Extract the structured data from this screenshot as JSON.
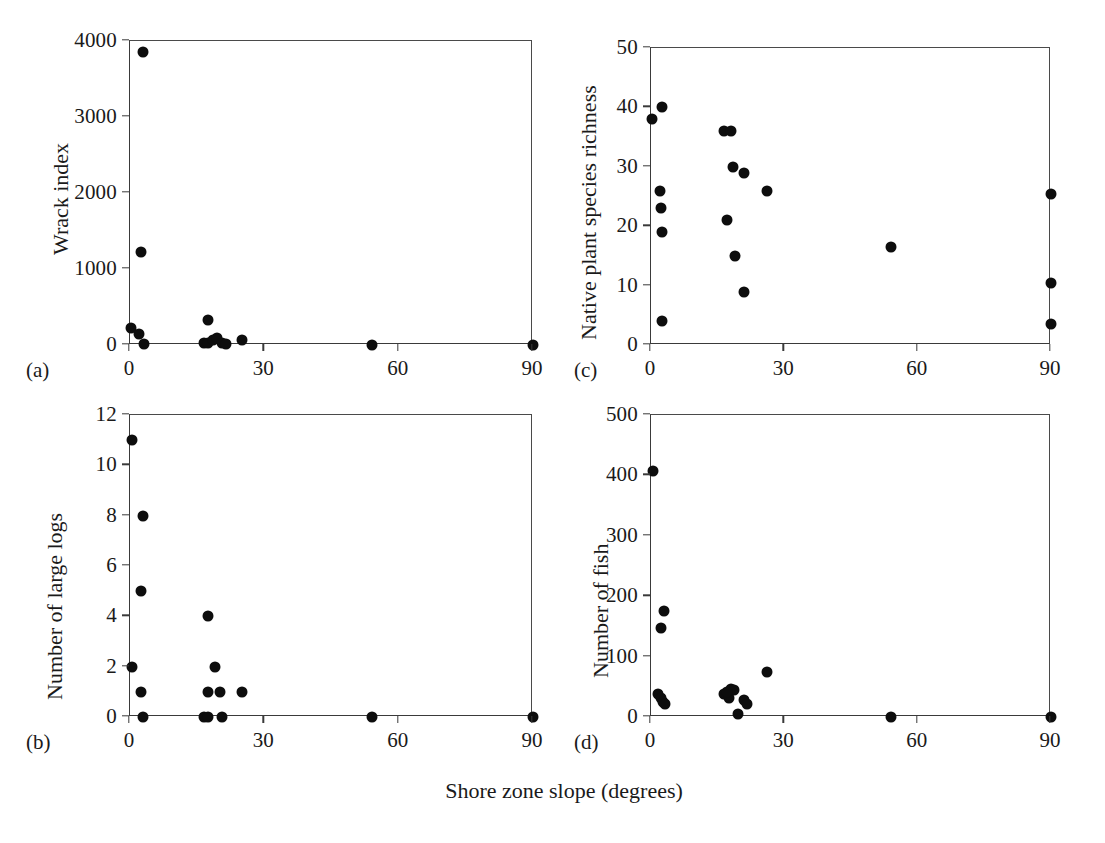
{
  "figure": {
    "shared_xaxis_title": "Shore zone slope (degrees)"
  },
  "panels": [
    {
      "letter": "(a)",
      "ylabel": "Wrack index",
      "xticks": [
        "0",
        "30",
        "60",
        "90"
      ],
      "yticks": [
        "0",
        "1000",
        "2000",
        "3000",
        "4000"
      ]
    },
    {
      "letter": "(b)",
      "ylabel": "Number of large logs",
      "xticks": [
        "0",
        "30",
        "60",
        "90"
      ],
      "yticks": [
        "0",
        "2",
        "4",
        "6",
        "8",
        "10",
        "12"
      ]
    },
    {
      "letter": "(c)",
      "ylabel": "Native plant species richness",
      "xticks": [
        "0",
        "30",
        "60",
        "90"
      ],
      "yticks": [
        "0",
        "10",
        "20",
        "30",
        "40",
        "50"
      ]
    },
    {
      "letter": "(d)",
      "ylabel": "Number of fish",
      "xticks": [
        "0",
        "30",
        "60",
        "90"
      ],
      "yticks": [
        "0",
        "100",
        "200",
        "300",
        "400",
        "500"
      ]
    }
  ],
  "chart_data": [
    {
      "type": "scatter",
      "panel": "a",
      "title": "",
      "xlabel": "Shore zone slope (degrees)",
      "ylabel": "Wrack index",
      "xlim": [
        0,
        90
      ],
      "ylim": [
        0,
        4000
      ],
      "xticks": [
        0,
        30,
        60,
        90
      ],
      "yticks": [
        0,
        1000,
        2000,
        3000,
        4000
      ],
      "grid": false,
      "legend": "none",
      "marker": "filled-circle",
      "marker_color": "#0d0d0d",
      "points": [
        {
          "x": 3.0,
          "y": 3850
        },
        {
          "x": 2.5,
          "y": 1220
        },
        {
          "x": 0.3,
          "y": 230
        },
        {
          "x": 2.0,
          "y": 140
        },
        {
          "x": 3.2,
          "y": 10
        },
        {
          "x": 17.5,
          "y": 330
        },
        {
          "x": 16.5,
          "y": 20
        },
        {
          "x": 17.5,
          "y": 30
        },
        {
          "x": 18.5,
          "y": 60
        },
        {
          "x": 19.5,
          "y": 90
        },
        {
          "x": 20.5,
          "y": 30
        },
        {
          "x": 21.5,
          "y": 10
        },
        {
          "x": 25.0,
          "y": 60
        },
        {
          "x": 54.0,
          "y": 0
        },
        {
          "x": 90.0,
          "y": 0
        }
      ]
    },
    {
      "type": "scatter",
      "panel": "b",
      "title": "",
      "xlabel": "Shore zone slope (degrees)",
      "ylabel": "Number of large logs",
      "xlim": [
        0,
        90
      ],
      "ylim": [
        0,
        12
      ],
      "xticks": [
        0,
        30,
        60,
        90
      ],
      "yticks": [
        0,
        2,
        4,
        6,
        8,
        10,
        12
      ],
      "grid": false,
      "legend": "none",
      "marker": "filled-circle",
      "marker_color": "#0d0d0d",
      "points": [
        {
          "x": 0.5,
          "y": 11
        },
        {
          "x": 3.0,
          "y": 8
        },
        {
          "x": 2.5,
          "y": 5
        },
        {
          "x": 0.5,
          "y": 2
        },
        {
          "x": 2.5,
          "y": 1
        },
        {
          "x": 3.0,
          "y": 0
        },
        {
          "x": 17.5,
          "y": 4
        },
        {
          "x": 19.0,
          "y": 2
        },
        {
          "x": 17.5,
          "y": 1
        },
        {
          "x": 20.0,
          "y": 1
        },
        {
          "x": 25.0,
          "y": 1
        },
        {
          "x": 16.5,
          "y": 0
        },
        {
          "x": 17.5,
          "y": 0
        },
        {
          "x": 20.5,
          "y": 0
        },
        {
          "x": 54.0,
          "y": 0
        },
        {
          "x": 90.0,
          "y": 0
        }
      ]
    },
    {
      "type": "scatter",
      "panel": "c",
      "title": "",
      "xlabel": "Shore zone slope (degrees)",
      "ylabel": "Native plant species richness",
      "xlim": [
        0,
        90
      ],
      "ylim": [
        0,
        50
      ],
      "xticks": [
        0,
        30,
        60,
        90
      ],
      "yticks": [
        0,
        10,
        20,
        30,
        40,
        50
      ],
      "grid": false,
      "legend": "none",
      "marker": "filled-circle",
      "marker_color": "#0d0d0d",
      "points": [
        {
          "x": 0.3,
          "y": 38
        },
        {
          "x": 2.5,
          "y": 40
        },
        {
          "x": 2.0,
          "y": 26
        },
        {
          "x": 2.2,
          "y": 23
        },
        {
          "x": 2.4,
          "y": 19
        },
        {
          "x": 2.5,
          "y": 4
        },
        {
          "x": 16.5,
          "y": 36
        },
        {
          "x": 18.0,
          "y": 36
        },
        {
          "x": 18.5,
          "y": 30
        },
        {
          "x": 21.0,
          "y": 29
        },
        {
          "x": 26.0,
          "y": 26
        },
        {
          "x": 17.0,
          "y": 21
        },
        {
          "x": 19.0,
          "y": 15
        },
        {
          "x": 21.0,
          "y": 9
        },
        {
          "x": 54.0,
          "y": 16.5
        },
        {
          "x": 90.0,
          "y": 25.5
        },
        {
          "x": 90.0,
          "y": 10.5
        },
        {
          "x": 90.0,
          "y": 3.5
        }
      ]
    },
    {
      "type": "scatter",
      "panel": "d",
      "title": "",
      "xlabel": "Shore zone slope (degrees)",
      "ylabel": "Number of fish",
      "xlim": [
        0,
        90
      ],
      "ylim": [
        0,
        500
      ],
      "xticks": [
        0,
        30,
        60,
        90
      ],
      "yticks": [
        0,
        100,
        200,
        300,
        400,
        500
      ],
      "grid": false,
      "legend": "none",
      "marker": "filled-circle",
      "marker_color": "#0d0d0d",
      "points": [
        {
          "x": 0.5,
          "y": 408
        },
        {
          "x": 3.0,
          "y": 175
        },
        {
          "x": 2.2,
          "y": 148
        },
        {
          "x": 1.6,
          "y": 38
        },
        {
          "x": 2.2,
          "y": 32
        },
        {
          "x": 2.8,
          "y": 25
        },
        {
          "x": 3.2,
          "y": 22
        },
        {
          "x": 16.5,
          "y": 38
        },
        {
          "x": 17.5,
          "y": 32
        },
        {
          "x": 18.0,
          "y": 47
        },
        {
          "x": 18.6,
          "y": 45
        },
        {
          "x": 17.2,
          "y": 42
        },
        {
          "x": 19.5,
          "y": 5
        },
        {
          "x": 21.0,
          "y": 28
        },
        {
          "x": 21.6,
          "y": 22
        },
        {
          "x": 26.0,
          "y": 74
        },
        {
          "x": 54.0,
          "y": 0
        },
        {
          "x": 90.0,
          "y": 0
        }
      ]
    }
  ]
}
